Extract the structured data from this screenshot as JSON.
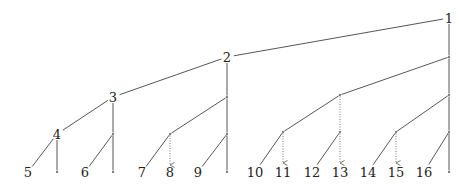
{
  "diagram": {
    "type": "binary-tree",
    "nodes": [
      {
        "id": "n1",
        "label": "1",
        "x": 449,
        "y": 18
      },
      {
        "id": "n2",
        "label": "2",
        "x": 227,
        "y": 57
      },
      {
        "id": "r1",
        "label": "",
        "x": 449,
        "y": 57
      },
      {
        "id": "n3",
        "label": "3",
        "x": 113,
        "y": 97
      },
      {
        "id": "d2",
        "label": "",
        "x": 227,
        "y": 97
      },
      {
        "id": "d3",
        "label": "",
        "x": 340,
        "y": 95
      },
      {
        "id": "d4",
        "label": "",
        "x": 449,
        "y": 95
      },
      {
        "id": "n4",
        "label": "4",
        "x": 57,
        "y": 134
      },
      {
        "id": "e1",
        "label": "",
        "x": 113,
        "y": 134
      },
      {
        "id": "e2",
        "label": "",
        "x": 170,
        "y": 134
      },
      {
        "id": "e3",
        "label": "",
        "x": 227,
        "y": 134
      },
      {
        "id": "e4",
        "label": "",
        "x": 283,
        "y": 132
      },
      {
        "id": "e5",
        "label": "",
        "x": 340,
        "y": 132
      },
      {
        "id": "e6",
        "label": "",
        "x": 396,
        "y": 132
      },
      {
        "id": "e7",
        "label": "",
        "x": 449,
        "y": 132
      },
      {
        "id": "n5",
        "label": "5",
        "x": 28,
        "y": 172
      },
      {
        "id": "f1",
        "label": "",
        "x": 57,
        "y": 172
      },
      {
        "id": "n6",
        "label": "6",
        "x": 85,
        "y": 172
      },
      {
        "id": "f2",
        "label": "",
        "x": 113,
        "y": 172
      },
      {
        "id": "n7",
        "label": "7",
        "x": 142,
        "y": 172
      },
      {
        "id": "n8",
        "label": "8",
        "x": 170,
        "y": 172
      },
      {
        "id": "n9",
        "label": "9",
        "x": 198,
        "y": 172
      },
      {
        "id": "f3",
        "label": "",
        "x": 227,
        "y": 172
      },
      {
        "id": "n10",
        "label": "10",
        "x": 255,
        "y": 172
      },
      {
        "id": "n11",
        "label": "11",
        "x": 283,
        "y": 172
      },
      {
        "id": "n12",
        "label": "12",
        "x": 312,
        "y": 172
      },
      {
        "id": "n13",
        "label": "13",
        "x": 340,
        "y": 172
      },
      {
        "id": "n14",
        "label": "14",
        "x": 368,
        "y": 172
      },
      {
        "id": "n15",
        "label": "15",
        "x": 396,
        "y": 172
      },
      {
        "id": "n16",
        "label": "16",
        "x": 424,
        "y": 172
      },
      {
        "id": "f4",
        "label": "",
        "x": 449,
        "y": 172
      }
    ],
    "edges": [
      {
        "from": "n1",
        "to": "n2",
        "style": "solid"
      },
      {
        "from": "n1",
        "to": "r1",
        "style": "solid"
      },
      {
        "from": "n2",
        "to": "n3",
        "style": "solid"
      },
      {
        "from": "n2",
        "to": "d2",
        "style": "solid"
      },
      {
        "from": "r1",
        "to": "d3",
        "style": "solid"
      },
      {
        "from": "r1",
        "to": "d4",
        "style": "solid"
      },
      {
        "from": "n3",
        "to": "n4",
        "style": "solid"
      },
      {
        "from": "n3",
        "to": "e1",
        "style": "solid"
      },
      {
        "from": "d2",
        "to": "e2",
        "style": "solid"
      },
      {
        "from": "d2",
        "to": "e3",
        "style": "solid"
      },
      {
        "from": "d3",
        "to": "e4",
        "style": "solid"
      },
      {
        "from": "d3",
        "to": "e5",
        "style": "dotted"
      },
      {
        "from": "d4",
        "to": "e6",
        "style": "solid"
      },
      {
        "from": "d4",
        "to": "e7",
        "style": "solid"
      },
      {
        "from": "n4",
        "to": "n5",
        "style": "solid"
      },
      {
        "from": "n4",
        "to": "f1",
        "style": "solid"
      },
      {
        "from": "e1",
        "to": "n6",
        "style": "solid"
      },
      {
        "from": "e1",
        "to": "f2",
        "style": "solid"
      },
      {
        "from": "e2",
        "to": "n7",
        "style": "solid"
      },
      {
        "from": "e2",
        "to": "n8",
        "style": "dotted-arrow"
      },
      {
        "from": "e3",
        "to": "n9",
        "style": "solid"
      },
      {
        "from": "e3",
        "to": "f3",
        "style": "solid"
      },
      {
        "from": "e4",
        "to": "n10",
        "style": "solid"
      },
      {
        "from": "e4",
        "to": "n11",
        "style": "dotted-arrow"
      },
      {
        "from": "e5",
        "to": "n12",
        "style": "solid"
      },
      {
        "from": "e5",
        "to": "n13",
        "style": "dotted-arrow"
      },
      {
        "from": "e6",
        "to": "n14",
        "style": "solid"
      },
      {
        "from": "e6",
        "to": "n15",
        "style": "dotted-arrow"
      },
      {
        "from": "e7",
        "to": "n16",
        "style": "solid"
      },
      {
        "from": "e7",
        "to": "f4",
        "style": "solid"
      }
    ]
  }
}
